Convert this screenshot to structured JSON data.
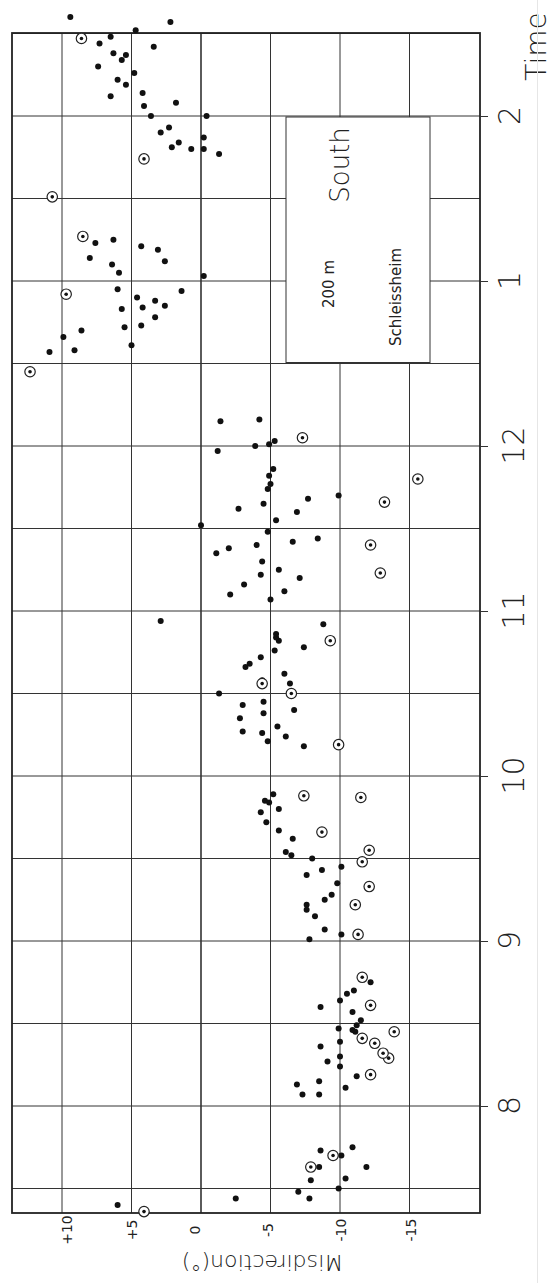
{
  "chart_data": {
    "type": "scatter",
    "orientation": "rotated-90",
    "title": "",
    "xlabel": "Time",
    "ylabel": "Misdirection(°)",
    "x_ticks": [
      "8",
      "9",
      "10",
      "11",
      "12",
      "1",
      "2"
    ],
    "y_ticks": [
      "+10",
      "+5",
      "0",
      "-5",
      "-10",
      "-15"
    ],
    "y_tick_values": [
      10,
      5,
      0,
      -5,
      -10,
      -15
    ],
    "xlim_hours": [
      7.33,
      14.5
    ],
    "ylim": [
      13.5,
      -20
    ],
    "grid": true,
    "annotation": {
      "direction": "South",
      "altitude": "200 m",
      "site": "Schleissheim"
    },
    "legend": [
      {
        "marker": "filled-dot",
        "meaning": "single observation"
      },
      {
        "marker": "ringed-dot",
        "meaning": "marked observation"
      }
    ],
    "series": [
      {
        "name": "filled",
        "points": [
          [
            7.4,
            6.0
          ],
          [
            7.44,
            -2.5
          ],
          [
            7.48,
            -7.0
          ],
          [
            7.44,
            -7.8
          ],
          [
            7.55,
            -7.9
          ],
          [
            7.63,
            -8.5
          ],
          [
            7.73,
            -8.6
          ],
          [
            7.7,
            -10.1
          ],
          [
            7.5,
            -9.9
          ],
          [
            7.56,
            -10.4
          ],
          [
            7.75,
            -10.9
          ],
          [
            7.63,
            -11.9
          ],
          [
            8.07,
            -7.3
          ],
          [
            8.13,
            -6.9
          ],
          [
            8.07,
            -8.5
          ],
          [
            8.15,
            -8.5
          ],
          [
            8.11,
            -10.4
          ],
          [
            8.27,
            -9.1
          ],
          [
            8.24,
            -10.0
          ],
          [
            8.18,
            -11.2
          ],
          [
            8.3,
            -10.0
          ],
          [
            8.36,
            -8.6
          ],
          [
            8.39,
            -10.0
          ],
          [
            8.47,
            -9.9
          ],
          [
            8.46,
            -10.9
          ],
          [
            8.45,
            -11.1
          ],
          [
            8.49,
            -11.2
          ],
          [
            8.52,
            -11.5
          ],
          [
            8.57,
            -10.9
          ],
          [
            8.6,
            -8.6
          ],
          [
            8.64,
            -10.0
          ],
          [
            8.68,
            -10.5
          ],
          [
            8.7,
            -11.0
          ],
          [
            8.75,
            -12.2
          ],
          [
            9.01,
            -7.8
          ],
          [
            9.07,
            -8.9
          ],
          [
            9.04,
            -10.1
          ],
          [
            9.15,
            -8.2
          ],
          [
            9.19,
            -7.6
          ],
          [
            9.22,
            -7.6
          ],
          [
            9.28,
            -9.4
          ],
          [
            9.25,
            -8.9
          ],
          [
            9.35,
            -9.8
          ],
          [
            9.4,
            -7.6
          ],
          [
            9.43,
            -8.7
          ],
          [
            9.45,
            -10.1
          ],
          [
            9.5,
            -8.0
          ],
          [
            9.52,
            -6.5
          ],
          [
            9.54,
            -6.1
          ],
          [
            9.62,
            -6.6
          ],
          [
            9.67,
            -5.6
          ],
          [
            9.72,
            -4.7
          ],
          [
            9.78,
            -4.3
          ],
          [
            9.8,
            -5.6
          ],
          [
            9.84,
            -4.9
          ],
          [
            9.85,
            -4.6
          ],
          [
            9.89,
            -5.2
          ],
          [
            10.18,
            -7.4
          ],
          [
            10.21,
            -4.8
          ],
          [
            10.24,
            -6.1
          ],
          [
            10.26,
            -4.4
          ],
          [
            10.27,
            -3.0
          ],
          [
            10.3,
            -5.5
          ],
          [
            10.35,
            -2.8
          ],
          [
            10.38,
            -4.5
          ],
          [
            10.4,
            -6.7
          ],
          [
            10.43,
            -3.0
          ],
          [
            10.45,
            -4.5
          ],
          [
            10.5,
            -1.3
          ],
          [
            10.56,
            -6.4
          ],
          [
            10.58,
            -4.4
          ],
          [
            10.62,
            -6.0
          ],
          [
            10.66,
            -3.2
          ],
          [
            10.68,
            -3.5
          ],
          [
            10.72,
            -4.3
          ],
          [
            10.76,
            -5.3
          ],
          [
            10.78,
            -7.4
          ],
          [
            10.82,
            -5.6
          ],
          [
            10.84,
            -5.4
          ],
          [
            10.86,
            -5.4
          ],
          [
            10.94,
            2.9
          ],
          [
            10.92,
            -8.8
          ],
          [
            11.07,
            -5.0
          ],
          [
            11.1,
            -2.1
          ],
          [
            11.12,
            -6.0
          ],
          [
            11.16,
            -3.1
          ],
          [
            11.2,
            -7.1
          ],
          [
            11.22,
            -4.3
          ],
          [
            11.25,
            -5.6
          ],
          [
            11.3,
            -4.4
          ],
          [
            11.35,
            -1.1
          ],
          [
            11.38,
            -2.0
          ],
          [
            11.4,
            -4.0
          ],
          [
            11.42,
            -6.6
          ],
          [
            11.44,
            -8.4
          ],
          [
            11.48,
            -4.8
          ],
          [
            11.52,
            0.0
          ],
          [
            11.55,
            -5.4
          ],
          [
            11.6,
            -6.9
          ],
          [
            11.62,
            -2.7
          ],
          [
            11.65,
            -4.5
          ],
          [
            11.68,
            -7.7
          ],
          [
            11.7,
            -9.9
          ],
          [
            11.74,
            -4.8
          ],
          [
            11.77,
            -5.0
          ],
          [
            11.82,
            -4.9
          ],
          [
            11.86,
            -5.2
          ],
          [
            11.97,
            -1.2
          ],
          [
            12.0,
            -3.9
          ],
          [
            12.01,
            -4.9
          ],
          [
            12.16,
            -4.2
          ],
          [
            12.15,
            -1.4
          ],
          [
            12.03,
            -5.3
          ],
          [
            12.57,
            10.9
          ],
          [
            12.66,
            9.9
          ],
          [
            12.58,
            9.1
          ],
          [
            12.7,
            8.6
          ],
          [
            12.72,
            5.5
          ],
          [
            12.61,
            5.0
          ],
          [
            12.73,
            4.3
          ],
          [
            12.84,
            4.2
          ],
          [
            12.78,
            3.3
          ],
          [
            12.85,
            2.6
          ],
          [
            12.88,
            3.3
          ],
          [
            12.9,
            4.6
          ],
          [
            12.83,
            5.7
          ],
          [
            12.95,
            6.0
          ],
          [
            13.03,
            -0.2
          ],
          [
            13.05,
            5.9
          ],
          [
            12.94,
            1.4
          ],
          [
            13.1,
            6.4
          ],
          [
            13.12,
            2.6
          ],
          [
            13.14,
            8.0
          ],
          [
            13.19,
            3.1
          ],
          [
            13.23,
            7.6
          ],
          [
            13.25,
            6.3
          ],
          [
            13.21,
            4.3
          ],
          [
            13.77,
            -1.3
          ],
          [
            13.8,
            -0.2
          ],
          [
            13.8,
            0.7
          ],
          [
            13.81,
            2.1
          ],
          [
            13.84,
            1.6
          ],
          [
            13.87,
            -0.2
          ],
          [
            13.9,
            2.9
          ],
          [
            13.93,
            2.3
          ],
          [
            14.0,
            -0.4
          ],
          [
            14.0,
            3.6
          ],
          [
            14.06,
            4.1
          ],
          [
            14.08,
            1.8
          ],
          [
            14.12,
            6.5
          ],
          [
            14.14,
            4.2
          ],
          [
            14.19,
            5.4
          ],
          [
            14.22,
            6.0
          ],
          [
            14.26,
            4.8
          ],
          [
            14.3,
            7.4
          ],
          [
            14.34,
            5.7
          ],
          [
            14.37,
            5.4
          ],
          [
            14.38,
            6.3
          ],
          [
            14.44,
            7.3
          ],
          [
            14.48,
            6.5
          ],
          [
            14.52,
            4.7
          ],
          [
            14.42,
            3.4
          ],
          [
            14.57,
            2.2
          ],
          [
            14.6,
            9.4
          ],
          [
            15.02,
            3.1
          ],
          [
            15.0,
            3.5
          ],
          [
            15.17,
            7.1
          ],
          [
            15.18,
            8.7
          ],
          [
            15.14,
            9.4
          ],
          [
            15.2,
            5.8
          ],
          [
            15.23,
            7.0
          ],
          [
            15.12,
            1.5
          ],
          [
            15.22,
            10.3
          ],
          [
            15.25,
            -1.9
          ],
          [
            15.27,
            -2.6
          ],
          [
            15.25,
            9.9
          ]
        ]
      },
      {
        "name": "ringed",
        "points": [
          [
            7.36,
            4.1
          ],
          [
            7.63,
            -7.9
          ],
          [
            7.7,
            -9.5
          ],
          [
            8.19,
            -12.2
          ],
          [
            8.29,
            -13.5
          ],
          [
            8.41,
            -11.6
          ],
          [
            8.32,
            -13.1
          ],
          [
            8.38,
            -12.5
          ],
          [
            8.45,
            -13.9
          ],
          [
            8.61,
            -12.2
          ],
          [
            8.78,
            -11.6
          ],
          [
            9.04,
            -11.3
          ],
          [
            9.22,
            -11.1
          ],
          [
            9.33,
            -12.1
          ],
          [
            9.48,
            -11.6
          ],
          [
            9.55,
            -12.1
          ],
          [
            9.66,
            -8.7
          ],
          [
            9.87,
            -11.5
          ],
          [
            9.88,
            -7.4
          ],
          [
            10.19,
            -9.9
          ],
          [
            10.5,
            -6.5
          ],
          [
            10.56,
            -4.4
          ],
          [
            10.82,
            -9.3
          ],
          [
            11.23,
            -12.9
          ],
          [
            11.4,
            -12.2
          ],
          [
            11.66,
            -13.2
          ],
          [
            11.8,
            -15.6
          ],
          [
            12.05,
            -7.3
          ],
          [
            12.45,
            12.3
          ],
          [
            12.92,
            9.7
          ],
          [
            13.27,
            8.5
          ],
          [
            13.51,
            10.7
          ],
          [
            13.74,
            4.1
          ],
          [
            14.47,
            8.6
          ],
          [
            14.87,
            10.8
          ],
          [
            14.93,
            11.1
          ],
          [
            15.15,
            2.8
          ],
          [
            15.22,
            9.4
          ]
        ]
      }
    ]
  },
  "axis": {
    "time_title": "Time",
    "misdirection_title": "Misdirection(°)"
  },
  "label_box": {
    "direction": "South",
    "altitude": "200 m",
    "site": "Schleissheim"
  }
}
